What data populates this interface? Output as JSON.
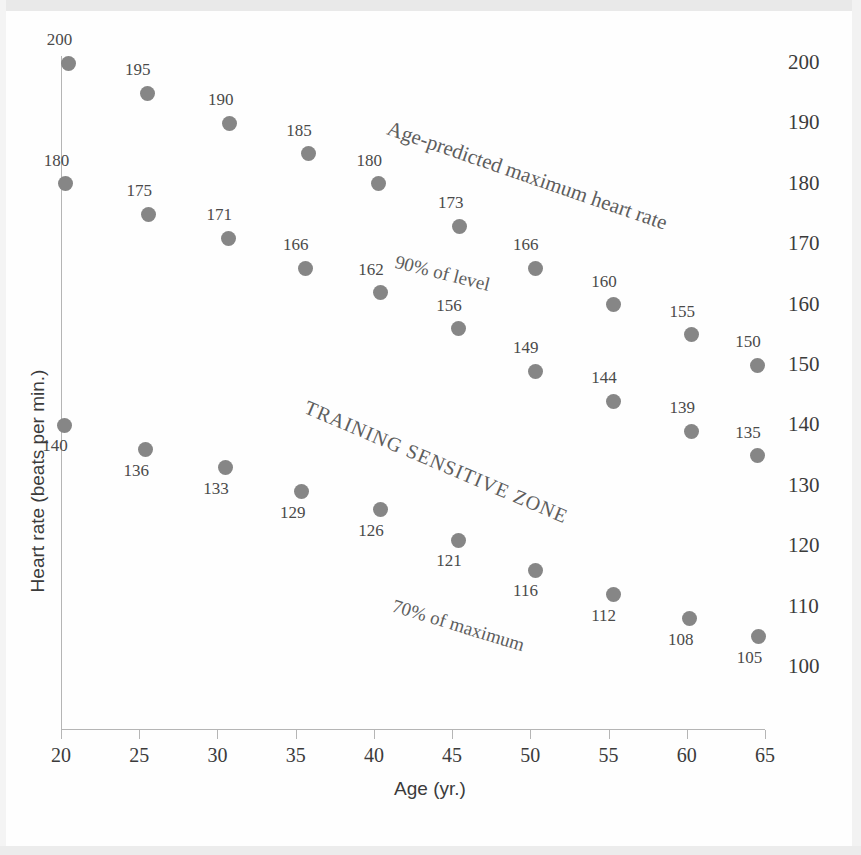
{
  "chart_data": {
    "type": "scatter",
    "title": "",
    "xlabel": "Age (yr.)",
    "ylabel": "Heart rate (beats per min.)",
    "xlim": [
      20,
      65
    ],
    "ylim": [
      95,
      205
    ],
    "xticks": [
      20,
      25,
      30,
      35,
      40,
      45,
      50,
      55,
      60,
      65
    ],
    "yticks": [
      100,
      110,
      120,
      130,
      140,
      150,
      160,
      170,
      180,
      190,
      200
    ],
    "grid": false,
    "legend": "none",
    "point_color": "#868686",
    "axis_color": "#b5b5b5",
    "text_color": "#3b3b3b",
    "annotations": [
      {
        "id": "max-hr-line",
        "text": "Age-predicted maximum heart rate"
      },
      {
        "id": "ninety-percent-line",
        "text": "90% of level"
      },
      {
        "id": "training-zone",
        "text": "TRAINING SENSITIVE ZONE"
      },
      {
        "id": "seventy-percent-line",
        "text": "70% of maximum"
      }
    ],
    "series": [
      {
        "name": "Age-predicted maximum heart rate",
        "x": [
          20.5,
          25.5,
          30.8,
          35.8,
          40.3,
          45.5,
          50.3,
          55.3,
          60.3,
          64.5
        ],
        "values": [
          200,
          195,
          190,
          185,
          180,
          173,
          166,
          160,
          155,
          150
        ],
        "labels": [
          "200",
          "195",
          "190",
          "185",
          "180",
          "173",
          "166",
          "160",
          "155",
          "150"
        ]
      },
      {
        "name": "90% of level",
        "x": [
          20.3,
          25.6,
          30.7,
          35.6,
          40.4,
          45.4,
          50.3,
          55.3,
          60.3,
          64.5
        ],
        "values": [
          180,
          175,
          171,
          166,
          162,
          156,
          149,
          144,
          139,
          135
        ],
        "labels": [
          "180",
          "175",
          "171",
          "166",
          "162",
          "156",
          "149",
          "144",
          "139",
          "135"
        ]
      },
      {
        "name": "70% of maximum",
        "x": [
          20.2,
          25.4,
          30.5,
          35.4,
          40.4,
          45.4,
          50.3,
          55.3,
          60.2,
          64.6
        ],
        "values": [
          140,
          136,
          133,
          129,
          126,
          121,
          116,
          112,
          108,
          105
        ],
        "labels": [
          "140",
          "136",
          "133",
          "129",
          "126",
          "121",
          "116",
          "112",
          "108",
          "105"
        ]
      }
    ]
  },
  "axes": {
    "x_title": "Age (yr.)",
    "y_title": "Heart rate (beats per min.)",
    "x_tick_labels": [
      "20",
      "25",
      "30",
      "35",
      "40",
      "45",
      "50",
      "55",
      "60",
      "65"
    ],
    "y_tick_labels": [
      "200",
      "190",
      "180",
      "170",
      "160",
      "150",
      "140",
      "130",
      "120",
      "110",
      "100"
    ]
  },
  "annotations": {
    "max_hr": "Age-predicted maximum heart rate",
    "ninety": "90% of level",
    "zone": "TRAINING SENSITIVE ZONE",
    "seventy": "70% of maximum"
  }
}
